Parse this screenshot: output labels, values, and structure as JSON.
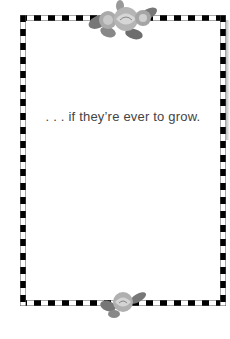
{
  "page": {
    "text": ". . . if they’re ever to grow."
  },
  "decorations": {
    "border": "black-white-checkered-frame",
    "top_ornament": "rose-cluster-icon",
    "bottom_ornament": "rose-icon"
  }
}
